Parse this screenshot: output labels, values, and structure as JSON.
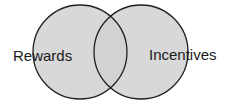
{
  "diagram": {
    "type": "venn",
    "sets": [
      {
        "label": "Rewards",
        "cx": 80,
        "cy": 52,
        "r": 47
      },
      {
        "label": "Incentives",
        "cx": 141,
        "cy": 52,
        "r": 47
      }
    ],
    "colors": {
      "fill": "#d8d8d8",
      "overlap_fill": "#d2d2d2",
      "stroke": "#1f1f1f",
      "background": "#ffffff"
    }
  }
}
